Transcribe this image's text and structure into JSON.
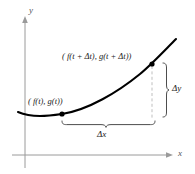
{
  "figure": {
    "axes": {
      "y_label": "y",
      "x_label": "x"
    },
    "labels": {
      "point_upper": "( f(t + Δt), g(t + Δt))",
      "point_lower": "( f(t), g(t))",
      "delta_y": "Δy",
      "delta_x": "Δx"
    },
    "colors": {
      "curve": "#000000",
      "axis": "#9a9a9a",
      "dashed": "#b0b0b0",
      "brace": "#4d4d4d",
      "point": "#000000",
      "background": "#ffffff"
    },
    "geometry": {
      "point_lower_xy": [
        62,
        114
      ],
      "point_upper_xy": [
        152,
        64
      ],
      "delta_x_span": [
        62,
        155
      ],
      "delta_y_span": [
        62,
        118
      ]
    }
  }
}
